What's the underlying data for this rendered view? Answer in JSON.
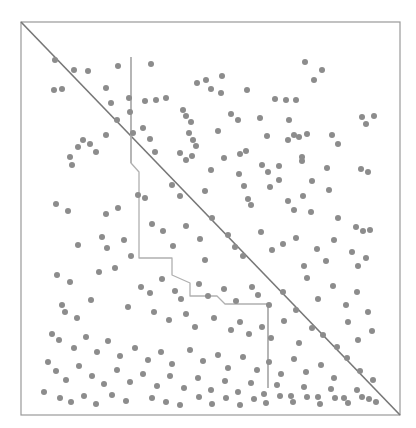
{
  "figure": {
    "title": "",
    "background_color": "#ffffff",
    "width": 416,
    "height": 428
  },
  "chart_data": {
    "type": "scatter",
    "title": "",
    "subtitle": "",
    "xlabel": "",
    "ylabel": "",
    "xlim": [
      0,
      100
    ],
    "ylim": [
      0,
      100
    ],
    "grid": false,
    "legend": null,
    "axis_ticks": {
      "x": [],
      "y": []
    },
    "plot_area_px": {
      "left": 21,
      "top": 22,
      "right": 400,
      "bottom": 415
    },
    "style": {
      "frame_color": "#999999",
      "frame_width": 1.2,
      "point_color": "#8c8c8c",
      "point_radius": 3.0,
      "diagonal_color": "#777777",
      "diagonal_width": 1.6,
      "step_color": "#b0b0b0",
      "step_width": 1.3,
      "vline_color": "#aaaaaa",
      "vline_width": 1.3
    },
    "series": [
      {
        "name": "points",
        "marker": "circle",
        "color": "#8c8c8c",
        "points": [
          [
            55,
            60
          ],
          [
            74,
            70
          ],
          [
            88,
            71
          ],
          [
            118,
            66
          ],
          [
            151,
            64
          ],
          [
            222,
            76
          ],
          [
            305,
            62
          ],
          [
            322,
            70
          ],
          [
            54,
            90
          ],
          [
            62,
            89
          ],
          [
            106,
            88
          ],
          [
            129,
            98
          ],
          [
            145,
            101
          ],
          [
            156,
            100
          ],
          [
            166,
            98
          ],
          [
            197,
            83
          ],
          [
            206,
            80
          ],
          [
            211,
            89
          ],
          [
            221,
            93
          ],
          [
            247,
            90
          ],
          [
            275,
            99
          ],
          [
            296,
            100
          ],
          [
            314,
            80
          ],
          [
            362,
            117
          ],
          [
            366,
            124
          ],
          [
            374,
            116
          ],
          [
            111,
            103
          ],
          [
            117,
            120
          ],
          [
            130,
            112
          ],
          [
            183,
            110
          ],
          [
            186,
            116
          ],
          [
            191,
            122
          ],
          [
            231,
            114
          ],
          [
            238,
            120
          ],
          [
            260,
            118
          ],
          [
            286,
            100
          ],
          [
            289,
            120
          ],
          [
            299,
            137
          ],
          [
            307,
            134
          ],
          [
            83,
            140
          ],
          [
            78,
            147
          ],
          [
            90,
            144
          ],
          [
            106,
            135
          ],
          [
            133,
            133
          ],
          [
            143,
            128
          ],
          [
            150,
            139
          ],
          [
            155,
            152
          ],
          [
            189,
            133
          ],
          [
            193,
            140
          ],
          [
            196,
            146
          ],
          [
            218,
            131
          ],
          [
            224,
            158
          ],
          [
            240,
            154
          ],
          [
            267,
            136
          ],
          [
            288,
            140
          ],
          [
            294,
            135
          ],
          [
            302,
            157
          ],
          [
            332,
            135
          ],
          [
            338,
            144
          ],
          [
            361,
            169
          ],
          [
            368,
            172
          ],
          [
            70,
            157
          ],
          [
            72,
            165
          ],
          [
            96,
            152
          ],
          [
            180,
            153
          ],
          [
            186,
            160
          ],
          [
            192,
            156
          ],
          [
            211,
            170
          ],
          [
            246,
            151
          ],
          [
            262,
            165
          ],
          [
            268,
            172
          ],
          [
            279,
            166
          ],
          [
            302,
            161
          ],
          [
            312,
            181
          ],
          [
            327,
            168
          ],
          [
            56,
            204
          ],
          [
            68,
            211
          ],
          [
            106,
            214
          ],
          [
            118,
            208
          ],
          [
            138,
            195
          ],
          [
            145,
            198
          ],
          [
            172,
            185
          ],
          [
            180,
            196
          ],
          [
            205,
            191
          ],
          [
            212,
            218
          ],
          [
            239,
            174
          ],
          [
            244,
            186
          ],
          [
            248,
            199
          ],
          [
            251,
            205
          ],
          [
            270,
            187
          ],
          [
            279,
            180
          ],
          [
            288,
            201
          ],
          [
            294,
            210
          ],
          [
            303,
            196
          ],
          [
            311,
            212
          ],
          [
            329,
            190
          ],
          [
            338,
            218
          ],
          [
            356,
            227
          ],
          [
            363,
            231
          ],
          [
            370,
            230
          ],
          [
            78,
            245
          ],
          [
            102,
            237
          ],
          [
            107,
            248
          ],
          [
            124,
            240
          ],
          [
            131,
            256
          ],
          [
            152,
            224
          ],
          [
            163,
            231
          ],
          [
            173,
            246
          ],
          [
            186,
            226
          ],
          [
            200,
            239
          ],
          [
            205,
            260
          ],
          [
            228,
            235
          ],
          [
            235,
            247
          ],
          [
            243,
            256
          ],
          [
            261,
            232
          ],
          [
            272,
            250
          ],
          [
            283,
            244
          ],
          [
            296,
            238
          ],
          [
            304,
            266
          ],
          [
            317,
            249
          ],
          [
            326,
            261
          ],
          [
            334,
            240
          ],
          [
            352,
            252
          ],
          [
            358,
            266
          ],
          [
            366,
            258
          ],
          [
            57,
            275
          ],
          [
            70,
            282
          ],
          [
            99,
            272
          ],
          [
            115,
            268
          ],
          [
            141,
            287
          ],
          [
            150,
            293
          ],
          [
            162,
            279
          ],
          [
            175,
            291
          ],
          [
            181,
            299
          ],
          [
            199,
            284
          ],
          [
            208,
            296
          ],
          [
            224,
            289
          ],
          [
            236,
            301
          ],
          [
            252,
            287
          ],
          [
            258,
            295
          ],
          [
            269,
            305
          ],
          [
            283,
            292
          ],
          [
            296,
            310
          ],
          [
            307,
            278
          ],
          [
            318,
            299
          ],
          [
            333,
            286
          ],
          [
            346,
            305
          ],
          [
            357,
            292
          ],
          [
            368,
            312
          ],
          [
            62,
            305
          ],
          [
            65,
            312
          ],
          [
            77,
            318
          ],
          [
            91,
            300
          ],
          [
            128,
            307
          ],
          [
            154,
            312
          ],
          [
            169,
            320
          ],
          [
            186,
            314
          ],
          [
            195,
            327
          ],
          [
            214,
            318
          ],
          [
            231,
            330
          ],
          [
            240,
            322
          ],
          [
            249,
            334
          ],
          [
            262,
            327
          ],
          [
            271,
            338
          ],
          [
            284,
            321
          ],
          [
            299,
            343
          ],
          [
            312,
            328
          ],
          [
            323,
            335
          ],
          [
            337,
            347
          ],
          [
            348,
            322
          ],
          [
            358,
            340
          ],
          [
            372,
            331
          ],
          [
            52,
            334
          ],
          [
            59,
            340
          ],
          [
            74,
            348
          ],
          [
            86,
            337
          ],
          [
            97,
            352
          ],
          [
            108,
            341
          ],
          [
            120,
            356
          ],
          [
            135,
            348
          ],
          [
            148,
            360
          ],
          [
            161,
            352
          ],
          [
            172,
            364
          ],
          [
            190,
            350
          ],
          [
            203,
            361
          ],
          [
            218,
            355
          ],
          [
            228,
            368
          ],
          [
            243,
            357
          ],
          [
            257,
            370
          ],
          [
            269,
            362
          ],
          [
            281,
            374
          ],
          [
            294,
            359
          ],
          [
            306,
            372
          ],
          [
            321,
            365
          ],
          [
            334,
            378
          ],
          [
            347,
            358
          ],
          [
            360,
            371
          ],
          [
            373,
            380
          ],
          [
            48,
            362
          ],
          [
            56,
            371
          ],
          [
            66,
            380
          ],
          [
            79,
            366
          ],
          [
            92,
            376
          ],
          [
            104,
            384
          ],
          [
            117,
            370
          ],
          [
            130,
            382
          ],
          [
            143,
            374
          ],
          [
            157,
            386
          ],
          [
            170,
            376
          ],
          [
            184,
            388
          ],
          [
            198,
            378
          ],
          [
            211,
            390
          ],
          [
            225,
            381
          ],
          [
            238,
            392
          ],
          [
            251,
            383
          ],
          [
            264,
            394
          ],
          [
            277,
            385
          ],
          [
            291,
            396
          ],
          [
            304,
            387
          ],
          [
            318,
            397
          ],
          [
            331,
            389
          ],
          [
            344,
            398
          ],
          [
            357,
            390
          ],
          [
            369,
            399
          ],
          [
            44,
            392
          ],
          [
            60,
            398
          ],
          [
            71,
            402
          ],
          [
            84,
            396
          ],
          [
            96,
            404
          ],
          [
            152,
            398
          ],
          [
            166,
            402
          ],
          [
            112,
            395
          ],
          [
            126,
            401
          ],
          [
            180,
            405
          ],
          [
            199,
            397
          ],
          [
            212,
            404
          ],
          [
            226,
            398
          ],
          [
            240,
            405
          ],
          [
            254,
            399
          ],
          [
            266,
            403
          ],
          [
            280,
            396
          ],
          [
            293,
            402
          ],
          [
            307,
            397
          ],
          [
            320,
            404
          ],
          [
            335,
            398
          ],
          [
            348,
            403
          ],
          [
            362,
            397
          ],
          [
            376,
            402
          ]
        ]
      }
    ],
    "annotations": {
      "diagonal_line": {
        "name": "identity-diagonal",
        "from": [
          21,
          22
        ],
        "to": [
          400,
          415
        ]
      },
      "step_path": {
        "name": "staircase-boundary",
        "vertices": [
          [
            131,
            57
          ],
          [
            131,
            163
          ],
          [
            139,
            172
          ],
          [
            139,
            258
          ],
          [
            172,
            258
          ],
          [
            172,
            275
          ],
          [
            190,
            283
          ],
          [
            190,
            296
          ],
          [
            217,
            296
          ],
          [
            225,
            304
          ],
          [
            268,
            304
          ],
          [
            268,
            388
          ]
        ]
      },
      "vertical_lines": [
        {
          "name": "upper-vertical-line",
          "x": 131,
          "y0": 57,
          "y1": 163
        },
        {
          "name": "lower-vertical-line",
          "x": 268,
          "y0": 304,
          "y1": 388
        }
      ]
    }
  }
}
